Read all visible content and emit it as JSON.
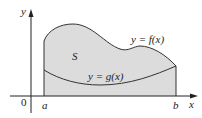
{
  "figure": {
    "labels": {
      "y_axis": "y",
      "x_axis": "x",
      "origin": "0",
      "a": "a",
      "b": "b",
      "region": "S",
      "f_curve": "y = f(x)",
      "g_curve": "y = g(x)"
    },
    "colors": {
      "region_fill": "#dcdcdc",
      "curve_stroke": "#333333",
      "axis_stroke": "#222222",
      "background": "#ffffff"
    }
  }
}
